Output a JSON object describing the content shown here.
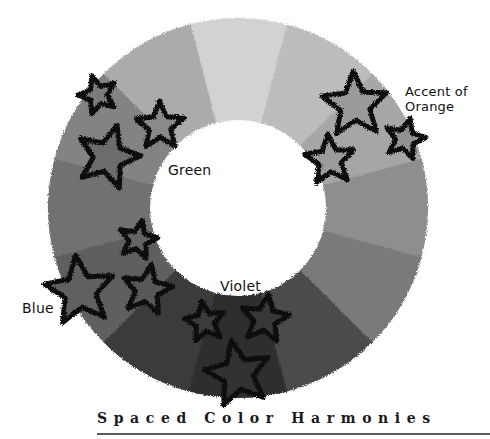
{
  "diagram": {
    "title": "Spaced Color Harmonies",
    "type": "color-wheel",
    "wheel": {
      "center": [
        238,
        208
      ],
      "outer_radius": 190,
      "inner_radius": 88,
      "segment_count": 12,
      "start_angle_deg": -105,
      "segments": [
        {
          "name": "yellow",
          "fill": "#d2d2d2"
        },
        {
          "name": "yellow-orange",
          "fill": "#bcbcbc"
        },
        {
          "name": "orange",
          "fill": "#a6a6a6"
        },
        {
          "name": "red-orange",
          "fill": "#8e8e8e"
        },
        {
          "name": "red",
          "fill": "#7a7a7a"
        },
        {
          "name": "red-violet",
          "fill": "#4c4c4c"
        },
        {
          "name": "violet",
          "fill": "#2f2f2f"
        },
        {
          "name": "blue-violet",
          "fill": "#3b3b3b"
        },
        {
          "name": "blue",
          "fill": "#5e5e5e"
        },
        {
          "name": "blue-green",
          "fill": "#717171"
        },
        {
          "name": "green",
          "fill": "#838383"
        },
        {
          "name": "yellow-green",
          "fill": "#ababab"
        }
      ]
    },
    "labels": {
      "green": "Green",
      "violet": "Violet",
      "blue": "Blue",
      "accent_line1": "Accent of",
      "accent_line2": "Orange"
    },
    "stars": [
      {
        "group": "green",
        "cx": 98,
        "cy": 95,
        "r": 20,
        "fill": "#7c7c7c"
      },
      {
        "group": "green",
        "cx": 160,
        "cy": 126,
        "r": 25,
        "fill": "#8a8a8a"
      },
      {
        "group": "green",
        "cx": 108,
        "cy": 157,
        "r": 33,
        "fill": "#6c6c6c"
      },
      {
        "group": "accent",
        "cx": 355,
        "cy": 105,
        "r": 34,
        "fill": "#9a9a9a"
      },
      {
        "group": "accent",
        "cx": 405,
        "cy": 139,
        "r": 21,
        "fill": "#929292"
      },
      {
        "group": "accent",
        "cx": 330,
        "cy": 160,
        "r": 26,
        "fill": "#9c9c9c"
      },
      {
        "group": "blue",
        "cx": 138,
        "cy": 240,
        "r": 20,
        "fill": "#646464"
      },
      {
        "group": "blue",
        "cx": 80,
        "cy": 291,
        "r": 36,
        "fill": "#606060"
      },
      {
        "group": "blue",
        "cx": 147,
        "cy": 290,
        "r": 26,
        "fill": "#585858"
      },
      {
        "group": "violet",
        "cx": 205,
        "cy": 322,
        "r": 21,
        "fill": "#3a3a3a"
      },
      {
        "group": "violet",
        "cx": 265,
        "cy": 319,
        "r": 25,
        "fill": "#383838"
      },
      {
        "group": "violet",
        "cx": 238,
        "cy": 374,
        "r": 34,
        "fill": "#333333"
      }
    ]
  },
  "colors": {
    "background": "#ffffff",
    "star_outline": "#0d0d0d",
    "caption": "#1a1a1a",
    "rule": "#5a5a5a"
  }
}
